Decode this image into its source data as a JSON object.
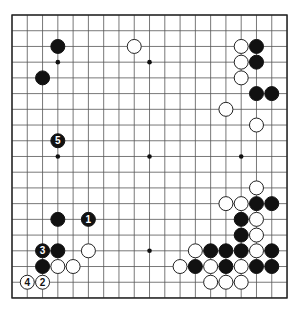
{
  "board": {
    "size": 19,
    "origin_x": 12,
    "origin_y": 15,
    "spacing_x": 15.28,
    "spacing_y": 15.72,
    "line_color": "#555555",
    "border_color": "#222222",
    "background": "#ffffff",
    "stone_radius": 7,
    "star_points": [
      [
        3,
        3
      ],
      [
        9,
        3
      ],
      [
        15,
        3
      ],
      [
        3,
        9
      ],
      [
        9,
        9
      ],
      [
        15,
        9
      ],
      [
        3,
        15
      ],
      [
        9,
        15
      ],
      [
        15,
        15
      ]
    ]
  },
  "stones": [
    {
      "color": "black",
      "col": 3,
      "row": 2,
      "label": ""
    },
    {
      "color": "white",
      "col": 8,
      "row": 2,
      "label": ""
    },
    {
      "color": "black",
      "col": 2,
      "row": 4,
      "label": ""
    },
    {
      "color": "black",
      "col": 3,
      "row": 8,
      "label": "5"
    },
    {
      "color": "white",
      "col": 15,
      "row": 2,
      "label": ""
    },
    {
      "color": "black",
      "col": 16,
      "row": 2,
      "label": ""
    },
    {
      "color": "white",
      "col": 15,
      "row": 3,
      "label": ""
    },
    {
      "color": "black",
      "col": 16,
      "row": 3,
      "label": ""
    },
    {
      "color": "white",
      "col": 15,
      "row": 4,
      "label": ""
    },
    {
      "color": "black",
      "col": 16,
      "row": 5,
      "label": ""
    },
    {
      "color": "black",
      "col": 17,
      "row": 5,
      "label": ""
    },
    {
      "color": "white",
      "col": 14,
      "row": 6,
      "label": ""
    },
    {
      "color": "white",
      "col": 16,
      "row": 7,
      "label": ""
    },
    {
      "color": "white",
      "col": 16,
      "row": 11,
      "label": ""
    },
    {
      "color": "white",
      "col": 14,
      "row": 12,
      "label": ""
    },
    {
      "color": "white",
      "col": 15,
      "row": 12,
      "label": ""
    },
    {
      "color": "black",
      "col": 16,
      "row": 12,
      "label": ""
    },
    {
      "color": "black",
      "col": 17,
      "row": 12,
      "label": ""
    },
    {
      "color": "black",
      "col": 15,
      "row": 13,
      "label": ""
    },
    {
      "color": "white",
      "col": 16,
      "row": 13,
      "label": ""
    },
    {
      "color": "black",
      "col": 15,
      "row": 14,
      "label": ""
    },
    {
      "color": "white",
      "col": 16,
      "row": 14,
      "label": ""
    },
    {
      "color": "black",
      "col": 3,
      "row": 13,
      "label": ""
    },
    {
      "color": "black",
      "col": 5,
      "row": 13,
      "label": "1"
    },
    {
      "color": "black",
      "col": 2,
      "row": 15,
      "label": "3"
    },
    {
      "color": "black",
      "col": 3,
      "row": 15,
      "label": ""
    },
    {
      "color": "white",
      "col": 5,
      "row": 15,
      "label": ""
    },
    {
      "color": "black",
      "col": 2,
      "row": 16,
      "label": ""
    },
    {
      "color": "white",
      "col": 3,
      "row": 16,
      "label": ""
    },
    {
      "color": "white",
      "col": 4,
      "row": 16,
      "label": ""
    },
    {
      "color": "white",
      "col": 1,
      "row": 17,
      "label": "4"
    },
    {
      "color": "white",
      "col": 2,
      "row": 17,
      "label": "2"
    },
    {
      "color": "white",
      "col": 12,
      "row": 15,
      "label": ""
    },
    {
      "color": "black",
      "col": 13,
      "row": 15,
      "label": ""
    },
    {
      "color": "black",
      "col": 14,
      "row": 15,
      "label": ""
    },
    {
      "color": "black",
      "col": 15,
      "row": 15,
      "label": ""
    },
    {
      "color": "white",
      "col": 16,
      "row": 15,
      "label": ""
    },
    {
      "color": "black",
      "col": 17,
      "row": 15,
      "label": ""
    },
    {
      "color": "white",
      "col": 11,
      "row": 16,
      "label": ""
    },
    {
      "color": "black",
      "col": 12,
      "row": 16,
      "label": ""
    },
    {
      "color": "white",
      "col": 13,
      "row": 16,
      "label": ""
    },
    {
      "color": "black",
      "col": 14,
      "row": 16,
      "label": ""
    },
    {
      "color": "white",
      "col": 15,
      "row": 16,
      "label": ""
    },
    {
      "color": "black",
      "col": 16,
      "row": 16,
      "label": ""
    },
    {
      "color": "black",
      "col": 17,
      "row": 16,
      "label": ""
    },
    {
      "color": "white",
      "col": 13,
      "row": 17,
      "label": ""
    },
    {
      "color": "white",
      "col": 14,
      "row": 17,
      "label": ""
    },
    {
      "color": "white",
      "col": 15,
      "row": 17,
      "label": ""
    }
  ],
  "colors": {
    "black_stone": "#111111",
    "white_stone": "#ffffff",
    "white_stone_outline": "#222222",
    "black_label": "#ffffff",
    "white_label": "#111111"
  }
}
